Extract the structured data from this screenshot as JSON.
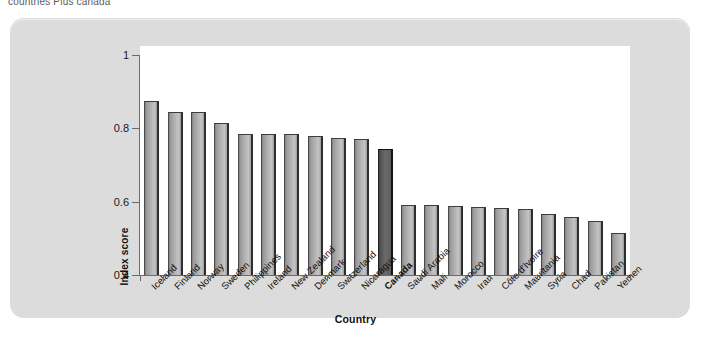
{
  "caption": "countries Plus canada",
  "chart_data": {
    "type": "bar",
    "title": "",
    "xlabel": "Country",
    "ylabel": "Index score",
    "ylim": [
      0.4,
      1.0
    ],
    "yticks": [
      "0.4",
      "0.6",
      "0.8",
      "1"
    ],
    "ytick_values": [
      0.4,
      0.6,
      0.8,
      1.0
    ],
    "grid": false,
    "legend": "none",
    "highlight_category": "Canada",
    "highlight_color": "#4a4a4a",
    "bar_color": "#b0b0b0",
    "categories": [
      "Iceland",
      "Finland",
      "Norway",
      "Sweden",
      "Philippines",
      "Ireland",
      "New Zealand",
      "Denmark",
      "Switzerland",
      "Nicaragua",
      "Canada",
      "Saudi Arabia",
      "Mali",
      "Morocco",
      "Iran",
      "Côte d'Ivoire",
      "Mauritania",
      "Syria",
      "Chad",
      "Pakistan",
      "Yemen"
    ],
    "values": [
      0.875,
      0.845,
      0.845,
      0.815,
      0.785,
      0.785,
      0.785,
      0.78,
      0.775,
      0.77,
      0.745,
      0.59,
      0.59,
      0.588,
      0.585,
      0.583,
      0.58,
      0.567,
      0.558,
      0.547,
      0.515
    ]
  },
  "colors": {
    "panel": "#dcdcdc",
    "plot": "#ffffff",
    "axis": "#6b6b6b",
    "text": "#111111"
  }
}
